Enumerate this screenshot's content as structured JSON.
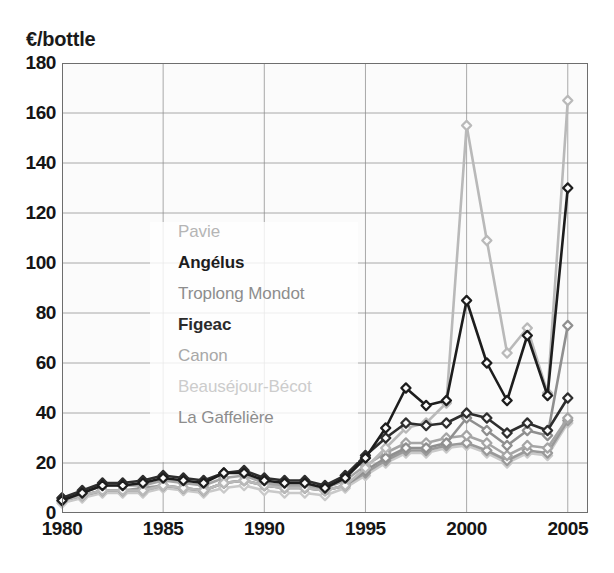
{
  "chart_data": {
    "type": "line",
    "title": "",
    "subtitle": "",
    "ylabel": "€/bottle",
    "xlabel": "",
    "ylim": [
      0,
      180
    ],
    "xlim": [
      1980,
      2006
    ],
    "yticks": [
      0,
      20,
      40,
      60,
      80,
      100,
      120,
      140,
      160,
      180
    ],
    "ytick_labels": [
      "0",
      "20",
      "40",
      "60",
      "80",
      "100",
      "120",
      "140",
      "160",
      "180"
    ],
    "xticks": [
      1980,
      1985,
      1990,
      1995,
      2000,
      2005
    ],
    "xtick_labels": [
      "1980",
      "1985",
      "1990",
      "1995",
      "2000",
      "2005"
    ],
    "grid": "both",
    "legend_position": "inside-left-middle",
    "marker": "diamond",
    "x": [
      1980,
      1981,
      1982,
      1983,
      1984,
      1985,
      1986,
      1987,
      1988,
      1989,
      1990,
      1991,
      1992,
      1993,
      1994,
      1995,
      1996,
      1997,
      1998,
      1999,
      2000,
      2001,
      2002,
      2003,
      2004,
      2005
    ],
    "series": [
      {
        "name": "Pavie",
        "color": "#b9b9b9",
        "values": [
          5,
          7,
          9,
          9,
          9,
          11,
          10,
          9,
          12,
          13,
          11,
          10,
          10,
          9,
          11,
          18,
          26,
          34,
          36,
          44,
          155,
          109,
          64,
          74,
          48,
          165
        ]
      },
      {
        "name": "Angélus",
        "color": "#1d1d1d",
        "values": [
          5,
          8,
          11,
          11,
          12,
          14,
          13,
          12,
          16,
          16,
          13,
          12,
          12,
          10,
          14,
          22,
          34,
          50,
          43,
          45,
          85,
          60,
          45,
          71,
          47,
          130
        ]
      },
      {
        "name": "Troplong Mondot",
        "color": "#8f8f8f",
        "values": [
          5,
          7,
          9,
          9,
          9,
          11,
          10,
          9,
          12,
          13,
          11,
          10,
          10,
          9,
          11,
          17,
          22,
          26,
          26,
          28,
          38,
          33,
          27,
          33,
          31,
          75
        ]
      },
      {
        "name": "Figeac",
        "color": "#2e2e2e",
        "values": [
          6,
          9,
          12,
          12,
          13,
          15,
          14,
          13,
          16,
          17,
          14,
          13,
          13,
          11,
          15,
          23,
          30,
          36,
          35,
          36,
          40,
          38,
          32,
          36,
          33,
          46
        ]
      },
      {
        "name": "Canon",
        "color": "#a5a5a5",
        "values": [
          6,
          8,
          11,
          11,
          11,
          13,
          12,
          11,
          14,
          15,
          12,
          11,
          11,
          10,
          13,
          19,
          24,
          28,
          28,
          30,
          31,
          28,
          23,
          27,
          26,
          38
        ]
      },
      {
        "name": "Beauséjour-Bécot",
        "color": "#c9c9c9",
        "values": [
          4,
          6,
          8,
          8,
          8,
          10,
          9,
          8,
          10,
          11,
          9,
          8,
          8,
          7,
          10,
          15,
          20,
          24,
          24,
          26,
          27,
          24,
          20,
          24,
          23,
          36
        ]
      },
      {
        "name": "La Gaffelière",
        "color": "#999999",
        "values": [
          5,
          7,
          9,
          9,
          10,
          11,
          10,
          9,
          12,
          13,
          11,
          10,
          10,
          9,
          11,
          16,
          21,
          25,
          25,
          27,
          28,
          25,
          21,
          25,
          24,
          37
        ]
      }
    ]
  },
  "legend": {
    "items": [
      {
        "label": "Pavie",
        "color": "#b5b5b5",
        "weight": "400"
      },
      {
        "label": "Angélus",
        "color": "#1d1d1d",
        "weight": "700"
      },
      {
        "label": "Troplong Mondot",
        "color": "#8d8d8d",
        "weight": "400"
      },
      {
        "label": "Figeac",
        "color": "#2b2b2b",
        "weight": "700"
      },
      {
        "label": "Canon",
        "color": "#a8a8a8",
        "weight": "400"
      },
      {
        "label": "Beauséjour-Bécot",
        "color": "#cccccc",
        "weight": "400"
      },
      {
        "label": "La Gaffelière",
        "color": "#8d8d8d",
        "weight": "400"
      }
    ]
  },
  "axes": {
    "y_title": "€/bottle"
  }
}
